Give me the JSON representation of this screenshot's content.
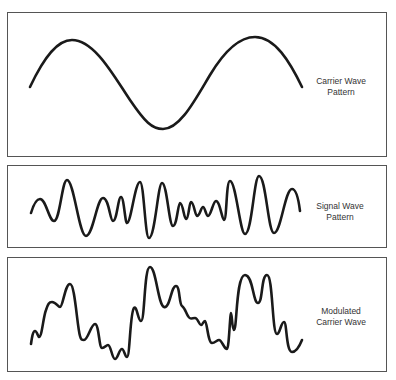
{
  "panels": [
    {
      "id": "carrier",
      "label_line1": "Carrier Wave",
      "label_line2": "Pattern",
      "path": "M30,87 C45,55 58,40 72,40 C95,40 115,78 130,100 C145,122 152,129 163,129 C180,129 195,100 210,75 C225,50 240,37 255,37 C275,37 290,62 302,87"
    },
    {
      "id": "signal",
      "label_line1": "Signal Wave",
      "label_line2": "Pattern",
      "path": "M31,213 C34,203 37,199 40,199 C46,199 49,221 54,221 C60,221 62,180 67,180 C74,180 79,236 86,236 C93,236 97,198 103,198 C109,198 110,221 113,221 C117,221 118,197 121,197 C124,197 125,223 127,223 C131,223 135,182 140,182 C144,182 145,238 149,238 C155,238 158,183 162,183 C167,183 169,226 173,226 C177,226 178,203 180,203 C183,203 184,219 186,219 C189,219 189,202 191,202 C194,202 195,216 197,216 C200,216 201,207 203,207 C205,207 206,216 208,216 C211,216 213,201 216,201 C220,201 222,220 224,220 C227,220 226,181 230,181 C236,181 240,234 245,234 C252,234 254,176 259,176 C266,176 268,233 274,233 C281,233 285,189 292,189 C297,189 299,203 300,211"
    },
    {
      "id": "modulated",
      "label_line1": "Modulated",
      "label_line2": "Carrier Wave",
      "path": "M31,344 C32,337 33,331 35,331 C37,331 38,337 39,337 C42,337 43,318 46,310 C48,304 49,302 52,302 C56,302 58,307 60,307 C63,307 65,284 70,284 C75,284 77,326 80,336 C81,340 82,340 84,340 C88,340 91,324 95,324 C99,324 99,348 102,348 C105,348 106,345 108,345 C111,345 112,359 115,359 C118,359 119,349 122,349 C124,349 125,357 127,357 C130,357 130,312 134,308 C137,305 138,321 141,321 C145,321 144,267 150,267 C156,267 158,305 164,307 C170,309 171,286 176,286 C180,286 179,304 182,306 C185,308 186,313 188,316 C190,320 192,318 195,318 C198,318 199,325 201,325 C203,325 203,321 205,321 C207,321 208,343 212,343 C215,343 217,340 219,340 C222,340 224,349 227,349 C229,349 230,313 231,313 C232,313 232,330 234,330 C237,330 236,275 245,275 C253,275 253,303 258,303 C263,303 261,275 267,275 C273,275 272,334 277,334 C280,334 281,322 284,322 C287,322 286,352 292,352 C297,352 300,345 302,340"
    }
  ],
  "colors": {
    "stroke": "#1a1a1a",
    "border": "#555555",
    "text": "#333333"
  }
}
